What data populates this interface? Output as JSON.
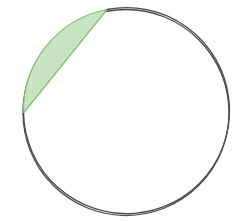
{
  "diagram": {
    "title": "Circle with shaded circular segment",
    "circle": {
      "cx": 126,
      "cy": 112.5,
      "r": 103,
      "stroke": "#4a4a4a",
      "stroke_width": 1.3,
      "fill": "#ffffff"
    },
    "segment": {
      "chord_start": {
        "x": 107,
        "y": 9.5
      },
      "chord_end": {
        "x": 23.5,
        "y": 113
      },
      "fill": "#cfe6c8",
      "stroke": "#7fbf74",
      "stroke_width": 1.2,
      "pattern": "fine-dot-shading"
    }
  }
}
